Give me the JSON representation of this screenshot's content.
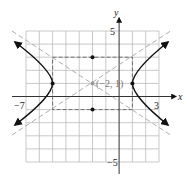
{
  "diagram": {
    "type": "hyperbola-graph",
    "axes": {
      "x_label": "x",
      "y_label": "y",
      "x_min_label": "−7",
      "x_max_label": "3",
      "y_max_label": "5",
      "y_min_label": "−5"
    },
    "center_label": "(−2, 1)",
    "center": [
      -2,
      1
    ],
    "vertices": [
      [
        -5,
        1
      ],
      [
        1,
        1
      ]
    ],
    "co_vertices": [
      [
        -2,
        3
      ],
      [
        -2,
        -1
      ]
    ],
    "box": {
      "x": [
        -5,
        1
      ],
      "y": [
        -1,
        3
      ]
    },
    "asymptote_slopes": [
      0.6667,
      -0.6667
    ],
    "grid": {
      "x_range": [
        -7,
        3
      ],
      "y_range": [
        -5,
        5
      ]
    },
    "colors": {
      "curve": "#111111",
      "grid": "#bbbbbb",
      "dashed": "#999999",
      "center": "#999999"
    }
  }
}
